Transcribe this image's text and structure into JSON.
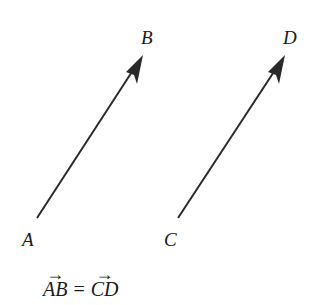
{
  "diagram": {
    "vectors": [
      {
        "name": "AB",
        "start_label": "A",
        "end_label": "B",
        "start": [
          37,
          218
        ],
        "end": [
          143,
          55
        ]
      },
      {
        "name": "CD",
        "start_label": "C",
        "end_label": "D",
        "start": [
          178,
          218
        ],
        "end": [
          285,
          55
        ]
      }
    ],
    "labels": {
      "A": "A",
      "B": "B",
      "C": "C",
      "D": "D"
    },
    "equation": {
      "left": "AB",
      "operator": "=",
      "right": "CD",
      "arrow": "→"
    },
    "colors": {
      "stroke": "#2a2a2a",
      "background": "#ffffff"
    }
  }
}
